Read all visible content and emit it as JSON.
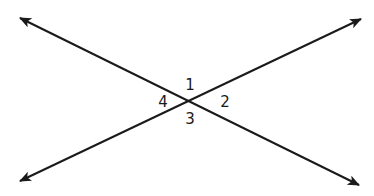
{
  "diagram": {
    "type": "intersecting-lines",
    "stroke_color": "#1a1a1a",
    "background": "#ffffff",
    "intersection": {
      "x": 191,
      "y": 101
    },
    "lines": [
      {
        "name": "line-a",
        "from": {
          "x": 20,
          "y": 18
        },
        "to": {
          "x": 359,
          "y": 185
        },
        "arrows": "both"
      },
      {
        "name": "line-b",
        "from": {
          "x": 20,
          "y": 181
        },
        "to": {
          "x": 361,
          "y": 19
        },
        "arrows": "both"
      }
    ],
    "angles": [
      {
        "label": "1",
        "x": 190,
        "y": 90
      },
      {
        "label": "2",
        "x": 225,
        "y": 107
      },
      {
        "label": "3",
        "x": 190,
        "y": 124
      },
      {
        "label": "4",
        "x": 163,
        "y": 107
      }
    ]
  }
}
